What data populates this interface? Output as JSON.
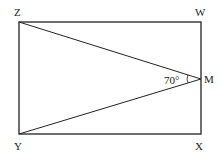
{
  "diagram": {
    "type": "geometry",
    "shape": "rectangle",
    "vertices": {
      "Z": {
        "label": "Z",
        "x": 19,
        "y": 22
      },
      "W": {
        "label": "W",
        "x": 201,
        "y": 22
      },
      "X": {
        "label": "X",
        "x": 201,
        "y": 134
      },
      "Y": {
        "label": "Y",
        "x": 19,
        "y": 134
      },
      "M": {
        "label": "M",
        "x": 201,
        "y": 79
      }
    },
    "segments": [
      "ZW",
      "WX",
      "XY",
      "YZ",
      "ZM",
      "YM"
    ],
    "angle": {
      "vertex": "M",
      "between": [
        "ZM",
        "YM"
      ],
      "label": "70°"
    },
    "colors": {
      "stroke": "#222222",
      "background": "#ffffff"
    }
  }
}
